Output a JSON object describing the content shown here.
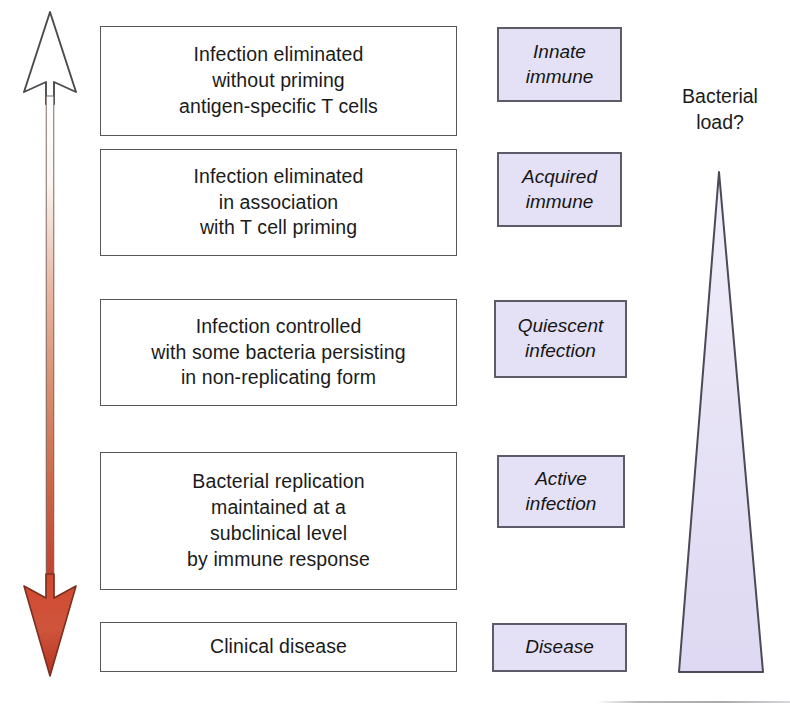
{
  "axis_arrow": {
    "name": "bidirectional-outcome-gradient-arrow",
    "top_head_style": "open-outline",
    "bottom_head_style": "filled-red",
    "gradient_top_color": "#ffffff",
    "gradient_bottom_color": "#c0392b",
    "outline_color": "#4b4b4f"
  },
  "outcomes": [
    {
      "id": "infection-eliminated-no-priming",
      "text": "Infection eliminated\nwithout priming\nantigen-specific T cells",
      "top": 26,
      "height": 110
    },
    {
      "id": "infection-eliminated-t-cell-priming",
      "text": "Infection eliminated\nin association\nwith T cell priming",
      "top": 149,
      "height": 107
    },
    {
      "id": "infection-controlled-persisting-bacteria",
      "text": "Infection controlled\nwith some bacteria persisting\nin non-replicating form",
      "top": 299,
      "height": 107
    },
    {
      "id": "bacterial-replication-subclinical",
      "text": "Bacterial replication\nmaintained at a\nsubclinical level\nby immune response",
      "top": 452,
      "height": 138
    },
    {
      "id": "clinical-disease",
      "text": "Clinical disease",
      "top": 622,
      "height": 50
    }
  ],
  "categories": [
    {
      "id": "innate-immune",
      "text": "Innate\nimmune",
      "top": 27,
      "height": 75
    },
    {
      "id": "acquired-immune",
      "text": "Acquired\nimmune",
      "top": 152,
      "height": 75
    },
    {
      "id": "quiescent-infection",
      "text": "Quiescent\ninfection",
      "top": 300,
      "height": 78
    },
    {
      "id": "active-infection",
      "text": "Active\ninfection",
      "top": 455,
      "height": 73
    },
    {
      "id": "disease",
      "text": "Disease",
      "top": 623,
      "height": 49
    }
  ],
  "bacterial_load": {
    "caption": "Bacterial\nload?",
    "shape": "triangle",
    "apex_position": "top",
    "base_position": "bottom",
    "fill_color": "#e2ddf4",
    "outline_color": "#4c4a55",
    "meaning": "bacterial load increases from top (none) to bottom (highest)"
  },
  "colors": {
    "box_fill": "#ffffff",
    "box_border": "#55555a",
    "category_fill": "#e4e0f5",
    "category_border": "#5d5b68",
    "text": "#1b1b1b",
    "arrow_red": "#c0392b"
  }
}
